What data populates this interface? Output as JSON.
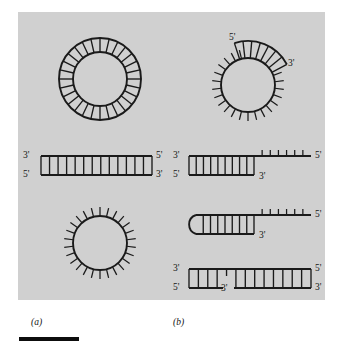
{
  "figure": {
    "background_color": "#d0d0d0",
    "page_color": "#ffffff",
    "stroke_color": "#1a1a1a",
    "panels": [
      {
        "id": "a",
        "label": "(a)"
      },
      {
        "id": "b",
        "label": "(b)"
      }
    ]
  },
  "labels": {
    "panel_a": "(a)",
    "panel_b": "(b)",
    "five_prime": "5'",
    "three_prime": "3'"
  },
  "structures": [
    {
      "name": "circular-double-stranded-dna",
      "panel": "a",
      "type": "circle-duplex",
      "center": [
        100,
        79
      ],
      "outer_radius": 41,
      "inner_radius": 27,
      "rung_count": 28,
      "end_labels": []
    },
    {
      "name": "circular-ssdna-with-duplex-region",
      "panel": "b",
      "type": "circle-ss-with-arc-duplex",
      "center": [
        248,
        85
      ],
      "radius": 27,
      "tick_count": 26,
      "tick_length": 9,
      "arc_start_deg": -108,
      "arc_end_deg": -28,
      "arc_rung_count": 7,
      "arc_outer_extra": 17,
      "end_labels": [
        {
          "text": "5'",
          "x": 229,
          "y": 33
        },
        {
          "text": "3'",
          "x": 288,
          "y": 59
        }
      ]
    },
    {
      "name": "linear-double-stranded-dna",
      "panel": "a",
      "type": "linear-duplex",
      "x_start": 41,
      "x_end": 152,
      "y_top": 156,
      "y_bottom": 175,
      "rung_count": 13,
      "end_labels": [
        {
          "text": "3'",
          "x": 23,
          "y": 151
        },
        {
          "text": "5'",
          "x": 23,
          "y": 170
        },
        {
          "text": "5'",
          "x": 156,
          "y": 151
        },
        {
          "text": "3'",
          "x": 156,
          "y": 170
        }
      ]
    },
    {
      "name": "circular-single-stranded-dna",
      "panel": "a",
      "type": "circle-ss",
      "center": [
        100,
        243
      ],
      "radius": 27,
      "tick_count": 26,
      "tick_length": 9,
      "end_labels": []
    },
    {
      "name": "partial-duplex-with-5prime-overhang",
      "panel": "b",
      "type": "duplex-with-tail",
      "x_start": 189,
      "x_duplex_end": 254,
      "x_tail_end": 311,
      "y_top": 156,
      "y_bottom": 175,
      "rung_count": 9,
      "tail_tick_count": 6,
      "tail_tick_length": 6,
      "end_labels": [
        {
          "text": "3'",
          "x": 173,
          "y": 151
        },
        {
          "text": "5'",
          "x": 173,
          "y": 170
        },
        {
          "text": "3'",
          "x": 259,
          "y": 172
        },
        {
          "text": "5'",
          "x": 315,
          "y": 151
        }
      ]
    },
    {
      "name": "hairpin-loop-with-5prime-tail",
      "panel": "b",
      "type": "hairpin",
      "loop_center": [
        196,
        225
      ],
      "loop_radius": 10,
      "x_stem_start": 196,
      "x_duplex_end": 254,
      "x_tail_end": 311,
      "y_top": 215,
      "y_bottom": 234,
      "rung_count": 8,
      "tail_tick_count": 6,
      "tail_tick_length": 6,
      "end_labels": [
        {
          "text": "3'",
          "x": 259,
          "y": 231
        },
        {
          "text": "5'",
          "x": 315,
          "y": 210
        }
      ]
    },
    {
      "name": "nicked-linear-duplex",
      "panel": "b",
      "type": "linear-duplex-nicked",
      "x_start": 189,
      "x_end": 311,
      "y_top": 269,
      "y_bottom": 288,
      "nick_x": 225,
      "rung_count": 13,
      "end_labels": [
        {
          "text": "3'",
          "x": 173,
          "y": 264
        },
        {
          "text": "5'",
          "x": 173,
          "y": 283
        },
        {
          "text": "3'",
          "x": 221,
          "y": 284
        },
        {
          "text": "5'",
          "x": 315,
          "y": 264
        },
        {
          "text": "3'",
          "x": 315,
          "y": 283
        }
      ]
    }
  ],
  "scale_bar": {
    "name": "scale-bar",
    "x": 19,
    "y": 337,
    "width": 60,
    "height": 4,
    "color": "#0d0d0d"
  }
}
